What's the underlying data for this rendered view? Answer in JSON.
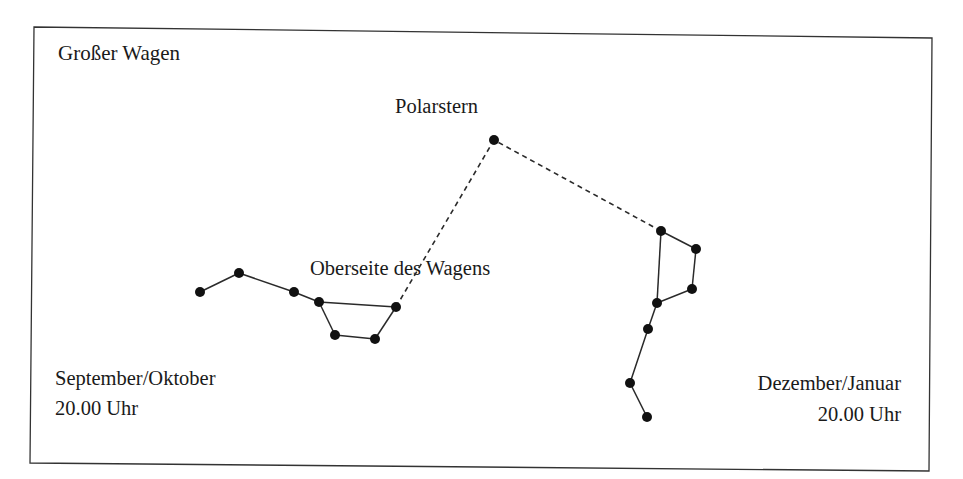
{
  "title": "Großer Wagen",
  "labels": {
    "polaris": "Polarstern",
    "wagon_top": "Oberseite des Wagens",
    "left_period": "September/Oktober",
    "left_time": "20.00 Uhr",
    "right_period": "Dezember/Januar",
    "right_time": "20.00 Uhr"
  },
  "colors": {
    "ink": "#111111",
    "line": "#2a2a2a",
    "background": "#ffffff"
  },
  "diagram": {
    "polaris": {
      "x": 494,
      "y": 140
    },
    "constellations": [
      {
        "name": "september-oktober",
        "stars": [
          [
            200,
            292
          ],
          [
            239,
            273
          ],
          [
            294,
            292
          ],
          [
            319,
            302
          ],
          [
            396,
            307
          ],
          [
            375,
            339
          ],
          [
            335,
            335
          ]
        ],
        "edges": [
          [
            0,
            1
          ],
          [
            1,
            2
          ],
          [
            2,
            3
          ],
          [
            3,
            4
          ],
          [
            4,
            5
          ],
          [
            5,
            6
          ],
          [
            6,
            3
          ]
        ],
        "pointer_star": 4
      },
      {
        "name": "dezember-januar",
        "stars": [
          [
            647,
            417
          ],
          [
            630,
            383
          ],
          [
            648,
            329
          ],
          [
            657,
            303
          ],
          [
            692,
            289
          ],
          [
            696,
            249
          ],
          [
            661,
            231
          ]
        ],
        "edges": [
          [
            0,
            1
          ],
          [
            1,
            2
          ],
          [
            2,
            3
          ],
          [
            3,
            4
          ],
          [
            4,
            5
          ],
          [
            5,
            6
          ],
          [
            6,
            3
          ]
        ],
        "pointer_star": 6
      }
    ]
  }
}
